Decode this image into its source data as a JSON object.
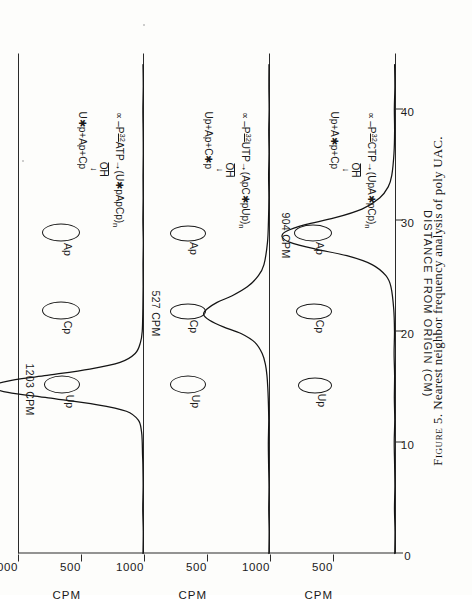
{
  "figure": {
    "caption_number": "Figure 5.",
    "caption_text": "Nearest neighbor frequency analysis of poly UAC.",
    "x_axis": {
      "title": "DISTANCE FROM ORIGIN (CM)",
      "ticks": [
        0,
        10,
        20,
        30,
        40
      ],
      "tick_labels": [
        "0",
        "10",
        "20",
        "30",
        "40"
      ],
      "range": [
        0,
        45
      ]
    },
    "y_axis": {
      "title": "CPM",
      "ticks": [
        0,
        500,
        1000
      ],
      "tick_labels": [
        "500",
        "1000"
      ],
      "range": [
        0,
        1000
      ]
    }
  },
  "panels": [
    {
      "id": "panel-1",
      "scheme": {
        "reactant": "∝ -P",
        "isotope": "32",
        "substrate": "ATP",
        "arrow": "→",
        "product_pre": "(Up",
        "product_star": "*",
        "product_post": "ApCp)n",
        "product_full": "∝ -P32ATP → (U*pApCp)n",
        "hydrolysis_label": "OH",
        "hydrolysis_arrow": "↓",
        "products": "U*p+Ap+Cp",
        "products_pre": "U",
        "products_star": "*",
        "products_post": "p+Ap+Cp"
      },
      "peak_callout": "1203 CPM",
      "spots": [
        {
          "label": "Up",
          "at": 15.0
        },
        {
          "label": "Cp",
          "at": 21.5
        },
        {
          "label": "Ap",
          "at": 28.5
        }
      ],
      "peak_center": 15.0,
      "peak_value": 1203
    },
    {
      "id": "panel-2",
      "scheme": {
        "product_full": "∝ -P32UTP → (ApC*pUp)n",
        "reactant": "∝ -P",
        "isotope": "32",
        "substrate": "UTP",
        "arrow": "→",
        "product_pre": "(ApC",
        "product_star": "*",
        "product_post": "pUp)n",
        "hydrolysis_label": "OH",
        "hydrolysis_arrow": "↓",
        "products": "Up+Ap+C*p",
        "products_pre": "Up+Ap+C",
        "products_star": "*",
        "products_post": "p"
      },
      "peak_callout": "527 CPM",
      "spots": [
        {
          "label": "Up",
          "at": 15.0
        },
        {
          "label": "Cp",
          "at": 21.5
        },
        {
          "label": "Ap",
          "at": 28.5
        }
      ],
      "peak_center": 21.5,
      "peak_value": 527
    },
    {
      "id": "panel-3",
      "scheme": {
        "product_full": "∝ -P32CTP → (UpA*pCp)n",
        "reactant": "∝ -P",
        "isotope": "32",
        "substrate": "CTP",
        "arrow": "→",
        "product_pre": "(UpA",
        "product_star": "*",
        "product_post": "pCp)n",
        "hydrolysis_label": "OH",
        "hydrolysis_arrow": "↓",
        "products": "Up+A*p+Cp",
        "products_pre": "Up+A",
        "products_star": "*",
        "products_post": "p+Cp"
      },
      "peak_callout": "904 CPM",
      "spots": [
        {
          "label": "Up",
          "at": 15.0
        },
        {
          "label": "Cp",
          "at": 21.5
        },
        {
          "label": "Ap",
          "at": 28.5
        }
      ],
      "peak_center": 28.5,
      "peak_value": 904
    }
  ],
  "chart_data": {
    "type": "line",
    "title": "Nearest neighbor frequency analysis of poly UAC.",
    "xlabel": "DISTANCE FROM ORIGIN (CM)",
    "ylabel": "CPM",
    "xlim": [
      0,
      45
    ],
    "ylim": [
      0,
      1000
    ],
    "xticks": [
      0,
      10,
      20,
      30,
      40
    ],
    "yticks": [
      0,
      500,
      1000
    ],
    "grid": false,
    "legend": "none",
    "series": [
      {
        "name": "∝-P32ATP → (U*pApCp)n",
        "panel": 1,
        "peak_position_cm": 15.0,
        "peak_cpm": 1203,
        "annotation": "1203 CPM",
        "x": [
          0,
          2,
          4,
          6,
          8,
          9,
          10,
          11,
          12,
          12.8,
          13.4,
          14,
          14.5,
          15,
          15.5,
          16,
          16.6,
          17.2,
          18,
          19,
          20,
          22,
          24,
          26,
          28,
          30,
          32,
          34,
          36,
          38,
          40,
          42,
          44
        ],
        "y": [
          8,
          6,
          10,
          7,
          9,
          12,
          14,
          20,
          45,
          140,
          380,
          760,
          1080,
          1203,
          1090,
          790,
          430,
          190,
          70,
          28,
          14,
          9,
          7,
          8,
          6,
          9,
          7,
          8,
          6,
          7,
          9,
          6,
          8
        ]
      },
      {
        "name": "∝-P32UTP → (ApC*pUp)n",
        "panel": 2,
        "peak_position_cm": 21.5,
        "peak_cpm": 527,
        "annotation": "527 CPM",
        "x": [
          0,
          2,
          4,
          6,
          8,
          10,
          12,
          14,
          15,
          16,
          17,
          18,
          19,
          19.8,
          20.4,
          21,
          21.5,
          22,
          22.6,
          23.2,
          24,
          25,
          26,
          28,
          30,
          32,
          34,
          36,
          38,
          40,
          42,
          44
        ],
        "y": [
          9,
          7,
          10,
          8,
          11,
          13,
          10,
          14,
          18,
          24,
          36,
          62,
          120,
          230,
          370,
          480,
          527,
          500,
          420,
          300,
          180,
          92,
          48,
          20,
          12,
          9,
          11,
          8,
          10,
          7,
          9,
          8
        ]
      },
      {
        "name": "∝-P32CTP → (UpA*pCp)n",
        "panel": 3,
        "peak_position_cm": 28.5,
        "peak_cpm": 904,
        "annotation": "904 CPM",
        "x": [
          0,
          2,
          4,
          6,
          8,
          10,
          12,
          14,
          16,
          18,
          20,
          22,
          24,
          25,
          26,
          26.8,
          27.4,
          28,
          28.5,
          29,
          29.6,
          30.2,
          31,
          32,
          33,
          34,
          36,
          38,
          40,
          42,
          44
        ],
        "y": [
          10,
          8,
          12,
          9,
          11,
          14,
          10,
          13,
          11,
          15,
          12,
          18,
          40,
          80,
          190,
          390,
          640,
          840,
          904,
          870,
          720,
          490,
          270,
          130,
          62,
          34,
          16,
          11,
          13,
          9,
          11
        ]
      }
    ],
    "markers": [
      {
        "panel": 1,
        "label": "Up",
        "x_cm": 15.0
      },
      {
        "panel": 1,
        "label": "Cp",
        "x_cm": 21.5
      },
      {
        "panel": 1,
        "label": "Ap",
        "x_cm": 28.5
      },
      {
        "panel": 2,
        "label": "Up",
        "x_cm": 15.0
      },
      {
        "panel": 2,
        "label": "Cp",
        "x_cm": 21.5
      },
      {
        "panel": 2,
        "label": "Ap",
        "x_cm": 28.5
      },
      {
        "panel": 3,
        "label": "Up",
        "x_cm": 15.0
      },
      {
        "panel": 3,
        "label": "Cp",
        "x_cm": 21.5
      },
      {
        "panel": 3,
        "label": "Ap",
        "x_cm": 28.5
      }
    ]
  },
  "colors": {
    "ink": "#141414",
    "paper": "#fdfdfb",
    "axis": "#2a2a2a"
  }
}
